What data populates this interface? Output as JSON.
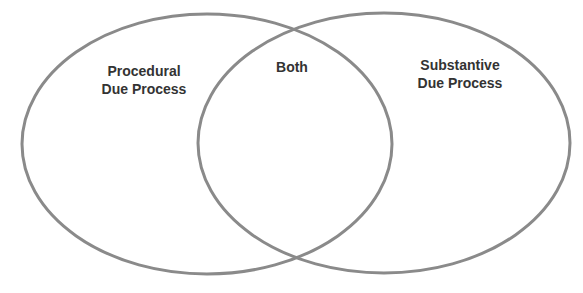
{
  "diagram": {
    "type": "venn",
    "stroke_color": "#8a8a8a",
    "text_color": "#333333",
    "sets": [
      {
        "id": "left",
        "label_lines": [
          "Procedural",
          "Due Process"
        ]
      },
      {
        "id": "right",
        "label_lines": [
          "Substantive",
          "Due Process"
        ]
      }
    ],
    "intersection": {
      "label": "Both"
    }
  }
}
